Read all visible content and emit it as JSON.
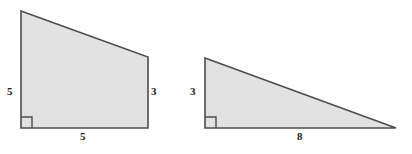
{
  "figure": {
    "type": "geometry-diagram",
    "background_color": "#ffffff",
    "shape_fill_color": "#e2e2e2",
    "shape_stroke_color": "#4d4d4d",
    "label_color": "#1a1a1a",
    "shapes": [
      {
        "id": "right-trapezoid",
        "name": "right trapezoid",
        "vertices": [
          [
            21,
            11
          ],
          [
            148,
            57
          ],
          [
            148,
            128
          ],
          [
            21,
            128
          ]
        ],
        "right_angle_marker": {
          "x": 21,
          "y": 117,
          "size": 11,
          "corner": "bottom-left"
        },
        "labels": [
          {
            "id": "trapezoid-left-side",
            "text": "5",
            "side": "left",
            "x": 7,
            "y": 86
          },
          {
            "id": "trapezoid-right-side",
            "text": "3",
            "side": "right",
            "x": 151,
            "y": 86
          },
          {
            "id": "trapezoid-bottom-side",
            "text": "5",
            "side": "bottom",
            "x": 80,
            "y": 131
          }
        ]
      },
      {
        "id": "right-triangle",
        "name": "right triangle",
        "vertices": [
          [
            205,
            58
          ],
          [
            396,
            128
          ],
          [
            205,
            128
          ]
        ],
        "right_angle_marker": {
          "x": 205,
          "y": 117,
          "size": 11,
          "corner": "bottom-left"
        },
        "labels": [
          {
            "id": "triangle-left-side",
            "text": "3",
            "side": "left",
            "x": 190,
            "y": 86
          },
          {
            "id": "triangle-bottom-side",
            "text": "8",
            "side": "bottom",
            "x": 297,
            "y": 131
          }
        ]
      }
    ]
  },
  "labels": {
    "trapezoid_left": "5",
    "trapezoid_right": "3",
    "trapezoid_bottom": "5",
    "triangle_left": "3",
    "triangle_bottom": "8"
  }
}
